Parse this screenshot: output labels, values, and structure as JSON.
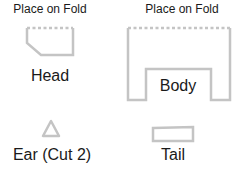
{
  "colors": {
    "outline": "#c4c4c4",
    "text": "#1a1a1a",
    "background": "#ffffff"
  },
  "pieces": {
    "head": {
      "name": "Head",
      "fold_note": "Place on Fold"
    },
    "body": {
      "name": "Body",
      "fold_note": "Place on Fold"
    },
    "ear": {
      "name": "Ear (Cut 2)"
    },
    "tail": {
      "name": "Tail"
    }
  }
}
